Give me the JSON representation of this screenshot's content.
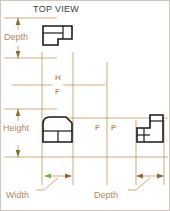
{
  "drawing": {
    "title": "TOP VIEW",
    "colors": {
      "object_line": "#1a1a1a",
      "dimension_line": "#c8a06a",
      "dimension_text": "#b08a5e",
      "plane_text": "#c09a6b",
      "title_text": "#3a3a3a",
      "border": "#cfc7bd",
      "accent_arrow": "#6fbf3a",
      "background": "#ffffff"
    },
    "labels": {
      "depth_left": "Depth",
      "height_left": "Height",
      "width_bottom": "Width",
      "depth_bottom": "Depth"
    },
    "plane_labels": {
      "horizontal": "H",
      "frontal_upper": "F",
      "frontal_lower": "F",
      "profile": "P"
    },
    "views": [
      {
        "name": "top-view",
        "shape": "l-block-top",
        "x": 42,
        "y": 25,
        "w": 31,
        "h": 25
      },
      {
        "name": "front-view",
        "shape": "rounded-block-front",
        "x": 43,
        "y": 115,
        "w": 30,
        "h": 27
      },
      {
        "name": "side-view",
        "shape": "l-block-side",
        "x": 136,
        "y": 114,
        "w": 28,
        "h": 28
      }
    ],
    "dimensions": [
      {
        "name": "depth-vertical",
        "label": "Depth",
        "orientation": "vertical",
        "x": 18,
        "y1": 17,
        "y2": 59
      },
      {
        "name": "height-vertical",
        "label": "Height",
        "orientation": "vertical",
        "x": 18,
        "y1": 108,
        "y2": 158
      },
      {
        "name": "width-horizontal",
        "label": "Width",
        "orientation": "horizontal",
        "y": 176,
        "x1": 45,
        "x2": 73
      },
      {
        "name": "depth-horizontal",
        "label": "Depth",
        "orientation": "horizontal",
        "y": 176,
        "x1": 136,
        "x2": 164
      }
    ]
  }
}
